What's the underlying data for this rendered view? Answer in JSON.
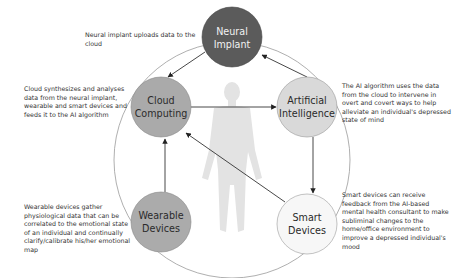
{
  "nodes": {
    "neural_implant": {
      "line1": "Neural",
      "line2": "Implant",
      "fill": "#5b5b5b",
      "text_color": "#f2f2f2"
    },
    "cloud_computing": {
      "line1": "Cloud",
      "line2": "Computing",
      "fill": "#aaaaaa",
      "text_color": "#2a2a2a"
    },
    "artificial_intelligence": {
      "line1": "Artificial",
      "line2": "Intelligence",
      "fill": "#d9d9d9",
      "text_color": "#2a2a2a"
    },
    "wearable_devices": {
      "line1": "Wearable",
      "line2": "Devices",
      "fill": "#ababab",
      "text_color": "#2a2a2a"
    },
    "smart_devices": {
      "line1": "Smart",
      "line2": "Devices",
      "fill": "#f7f7f7",
      "text_color": "#2a2a2a"
    }
  },
  "descriptions": {
    "neural_implant": "Neural implant uploads data to the cloud",
    "cloud_computing": "Cloud synthesizes and analyses data from the neural implant, wearable and smart devices and feeds it to the AI algorithm",
    "artificial_intelligence": "The AI algorithm uses the data from the cloud to intervene in overt and covert ways to help alleviate an individual's depressed state of mind",
    "wearable_devices": "Wearable devices gather physiological data that can be correlated to the emotional state of an individual and continually clarify/calibrate his/her emotional map",
    "smart_devices": "Smart devices can receive feedback from the AI-based mental health consultant to make subliminal changes to the home/office environment to improve a depressed individual's mood"
  },
  "center_figure": {
    "icon": "human-body-silhouette-icon",
    "color": "#e3e3e3"
  },
  "edges": [
    {
      "from": "neural_implant",
      "to": "cloud_computing"
    },
    {
      "from": "artificial_intelligence",
      "to": "neural_implant"
    },
    {
      "from": "cloud_computing",
      "to": "artificial_intelligence"
    },
    {
      "from": "artificial_intelligence",
      "to": "smart_devices"
    },
    {
      "from": "wearable_devices",
      "to": "cloud_computing"
    },
    {
      "from": "smart_devices",
      "to": "cloud_computing"
    }
  ]
}
